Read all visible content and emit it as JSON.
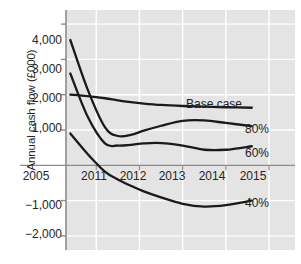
{
  "chart_data": {
    "type": "line",
    "title": "",
    "xlabel": "",
    "ylabel": "Annual cash flow (£000)",
    "xlim": [
      2010.3,
      2015.6
    ],
    "ylim": [
      -2400,
      4400
    ],
    "yticks": [
      4000,
      3000,
      2000,
      1000,
      -1000,
      -2000
    ],
    "ytick_labels": [
      "4,000",
      "3,000",
      "2,000",
      "1,000",
      "−1,000",
      "−2,000"
    ],
    "xticks": [
      2011,
      2012,
      2013,
      2014,
      2015
    ],
    "xtick_labels": [
      "2011",
      "2012",
      "2013",
      "2014",
      "2015"
    ],
    "x_origin_label": "2005",
    "grid": true,
    "grid_color": "#ffffff",
    "plot_background": "#e4e4e4",
    "axis_color": "#8c8c8c",
    "line_color": "#1a1a1a",
    "legend_position": "inline-right",
    "x": [
      2010.4,
      2010.8,
      2011.2,
      2011.5,
      2011.8,
      2012.1,
      2012.5,
      2013.0,
      2013.5,
      2014.0,
      2014.6
    ],
    "series": [
      {
        "name": "Base case",
        "label": "Base case",
        "values": [
          2000,
          1960,
          1900,
          1840,
          1790,
          1750,
          1710,
          1680,
          1660,
          1645,
          1630
        ]
      },
      {
        "name": "80%",
        "label": "80%",
        "values": [
          3550,
          2150,
          1080,
          830,
          860,
          980,
          1120,
          1260,
          1270,
          1200,
          1110
        ]
      },
      {
        "name": "60%",
        "label": "60%",
        "values": [
          2600,
          1380,
          620,
          560,
          580,
          620,
          630,
          560,
          440,
          440,
          540
        ]
      },
      {
        "name": "40%",
        "label": "40%",
        "values": [
          900,
          320,
          -180,
          -400,
          -580,
          -740,
          -910,
          -1090,
          -1170,
          -1130,
          -1000
        ]
      }
    ]
  }
}
